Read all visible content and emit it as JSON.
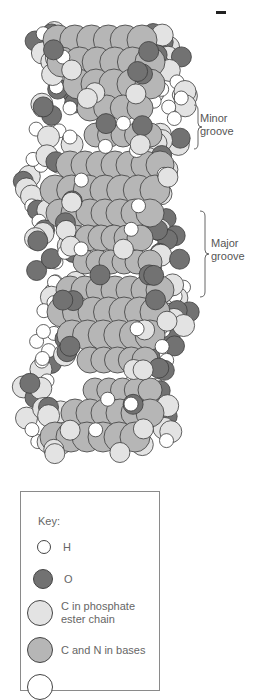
{
  "figure": {
    "title": "",
    "colors": {
      "H": "#ffffff",
      "O": "#727272",
      "C_phosphate": "#e3e3e3",
      "C_N_bases": "#b6b6b6",
      "outline": "#3c3c3c"
    }
  },
  "labels": {
    "minor_groove": [
      "Minor",
      "groove"
    ],
    "major_groove": [
      "Major",
      "groove"
    ]
  },
  "key": {
    "title": "Key:",
    "items": [
      {
        "atom": "H",
        "label": "H",
        "color": "#ffffff",
        "size": 14
      },
      {
        "atom": "O",
        "label": "O",
        "color": "#727272",
        "size": 20
      },
      {
        "atom": "C_phosphate",
        "label": "C in phosphate ester chain",
        "label_lines": [
          "C in phosphate",
          "ester chain"
        ],
        "color": "#e3e3e3",
        "size": 26
      },
      {
        "atom": "C_N_bases",
        "label": "C and N in bases",
        "color": "#b6b6b6",
        "size": 26
      },
      {
        "atom": "P",
        "label": "",
        "color": "#ffffff",
        "size": 26
      }
    ]
  },
  "helix_rows": [
    {
      "y": 40,
      "x0": 58,
      "x1": 142,
      "r": 15,
      "type": "base"
    },
    {
      "y": 62,
      "x0": 62,
      "x1": 150,
      "r": 15,
      "type": "base"
    },
    {
      "y": 84,
      "x0": 78,
      "x1": 150,
      "r": 15,
      "type": "base"
    },
    {
      "y": 108,
      "x0": 90,
      "x1": 140,
      "r": 13,
      "type": "base"
    },
    {
      "y": 135,
      "x0": 96,
      "x1": 150,
      "r": 12,
      "type": "base"
    },
    {
      "y": 165,
      "x0": 70,
      "x1": 160,
      "r": 14,
      "type": "base"
    },
    {
      "y": 190,
      "x0": 55,
      "x1": 155,
      "r": 15,
      "type": "base"
    },
    {
      "y": 213,
      "x0": 60,
      "x1": 150,
      "r": 14,
      "type": "base"
    },
    {
      "y": 238,
      "x0": 75,
      "x1": 140,
      "r": 13,
      "type": "base"
    },
    {
      "y": 262,
      "x0": 85,
      "x1": 150,
      "r": 12,
      "type": "base"
    },
    {
      "y": 290,
      "x0": 70,
      "x1": 160,
      "r": 14,
      "type": "base"
    },
    {
      "y": 312,
      "x0": 62,
      "x1": 155,
      "r": 15,
      "type": "base"
    },
    {
      "y": 335,
      "x0": 72,
      "x1": 150,
      "r": 15,
      "type": "base"
    },
    {
      "y": 360,
      "x0": 90,
      "x1": 145,
      "r": 13,
      "type": "base"
    },
    {
      "y": 390,
      "x0": 95,
      "x1": 150,
      "r": 12,
      "type": "base"
    },
    {
      "y": 413,
      "x0": 75,
      "x1": 150,
      "r": 14,
      "type": "base"
    },
    {
      "y": 437,
      "x0": 55,
      "x1": 135,
      "r": 15,
      "type": "base"
    }
  ]
}
